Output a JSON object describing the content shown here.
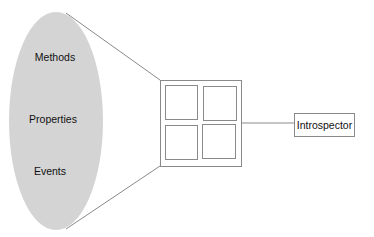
{
  "diagram": {
    "bean": {
      "members": [
        {
          "label": "Methods",
          "y": 57
        },
        {
          "label": "Properties",
          "y": 119
        },
        {
          "label": "Events",
          "y": 171
        }
      ]
    },
    "component": {
      "panes": 4
    },
    "introspector": {
      "label": "Introspector"
    },
    "colors": {
      "ellipse_fill": "#d4d4d4",
      "line": "#8a8a8a",
      "text": "#111111"
    }
  }
}
